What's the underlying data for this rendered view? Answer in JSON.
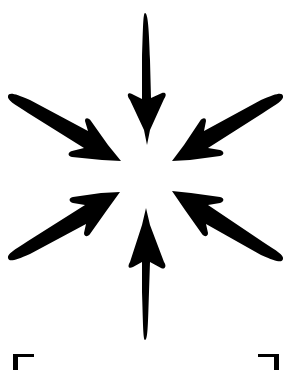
{
  "illustration": {
    "subject": "implode-icon",
    "description": "Eight hand-drawn arrows pointing inward toward a common center, with bracket corners at the bottom edge",
    "colors": {
      "foreground": "#000000",
      "background": "#ffffff"
    },
    "arrows": [
      {
        "name": "arrow-top",
        "direction": "down",
        "tail": [
          146,
          13
        ],
        "tip": [
          146,
          145
        ],
        "barb_left": [
          127,
          97
        ],
        "barb_right": [
          166,
          97
        ]
      },
      {
        "name": "arrow-top-left",
        "direction": "down-right",
        "tail": [
          9,
          95
        ],
        "tip": [
          120,
          161
        ],
        "barb_left": [
          86,
          120
        ],
        "barb_right": [
          69,
          155
        ]
      },
      {
        "name": "arrow-top-right",
        "direction": "down-left",
        "tail": [
          282,
          96
        ],
        "tip": [
          173,
          161
        ],
        "barb_left": [
          203,
          118
        ],
        "barb_right": [
          223,
          150
        ]
      },
      {
        "name": "arrow-bottom-left",
        "direction": "up-right",
        "tail": [
          9,
          259
        ],
        "tip": [
          120,
          191
        ],
        "barb_left": [
          71,
          202
        ],
        "barb_right": [
          90,
          236
        ]
      },
      {
        "name": "arrow-bottom-right",
        "direction": "up-left",
        "tail": [
          282,
          260
        ],
        "tip": [
          172,
          191
        ],
        "barb_left": [
          222,
          201
        ],
        "barb_right": [
          203,
          236
        ]
      },
      {
        "name": "arrow-bottom",
        "direction": "up",
        "tail": [
          146,
          340
        ],
        "tip": [
          146,
          208
        ],
        "barb_left": [
          128,
          261
        ],
        "barb_right": [
          165,
          259
        ]
      }
    ],
    "brackets": [
      {
        "name": "bracket-left",
        "corner": [
          13,
          355
        ]
      },
      {
        "name": "bracket-right",
        "corner": [
          279,
          355
        ]
      }
    ]
  }
}
